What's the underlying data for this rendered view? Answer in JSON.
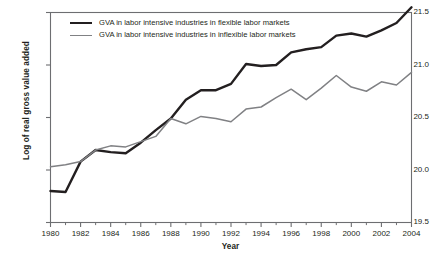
{
  "chart_data": {
    "type": "line",
    "title": "",
    "xlabel": "Year",
    "ylabel": "Log of real gross value added",
    "xlim": [
      1980,
      2004
    ],
    "ylim": [
      19.5,
      21.5
    ],
    "grid": false,
    "legend_position": "top-left-inside",
    "x": [
      1980,
      1981,
      1982,
      1983,
      1984,
      1985,
      1986,
      1987,
      1988,
      1989,
      1990,
      1991,
      1992,
      1993,
      1994,
      1995,
      1996,
      1997,
      1998,
      1999,
      2000,
      2001,
      2002,
      2003,
      2004
    ],
    "x_tick_labels": [
      "1980",
      "1982",
      "1984",
      "1986",
      "1988",
      "1990",
      "1992",
      "1994",
      "1996",
      "1998",
      "2000",
      "2002",
      "2004"
    ],
    "x_ticks_major": [
      1980,
      1982,
      1984,
      1986,
      1988,
      1990,
      1992,
      1994,
      1996,
      1998,
      2000,
      2002,
      2004
    ],
    "x_ticks_minor": [
      1981,
      1983,
      1985,
      1987,
      1989,
      1991,
      1993,
      1995,
      1997,
      1999,
      2001,
      2003
    ],
    "y_ticks": [
      19.5,
      20.0,
      20.5,
      21.0,
      21.5
    ],
    "y_tick_labels": [
      "19.5",
      "20.0",
      "20.5",
      "21.0",
      "21.5"
    ],
    "series": [
      {
        "name": "GVA in labor intensive industries in flexible labor markets",
        "color": "#231f20",
        "line_width": 2.4,
        "values": [
          19.8,
          19.79,
          20.08,
          20.19,
          20.17,
          20.16,
          20.26,
          20.38,
          20.49,
          20.67,
          20.76,
          20.76,
          20.82,
          21.01,
          20.99,
          21.0,
          21.12,
          21.15,
          21.17,
          21.28,
          21.3,
          21.27,
          21.33,
          21.4,
          21.55
        ]
      },
      {
        "name": "GVA in labor intensive industries in inflexible labor markets",
        "color": "#808184",
        "line_width": 1.5,
        "values": [
          20.03,
          20.05,
          20.08,
          20.19,
          20.23,
          20.22,
          20.27,
          20.32,
          20.49,
          20.44,
          20.51,
          20.49,
          20.46,
          20.58,
          20.6,
          20.69,
          20.77,
          20.67,
          20.78,
          20.9,
          20.79,
          20.75,
          20.84,
          20.81,
          20.93
        ]
      }
    ]
  },
  "legend": {
    "items": [
      {
        "label": "GVA in labor intensive industries in flexible labor markets"
      },
      {
        "label": "GVA in labor intensive industries in inflexible labor markets"
      }
    ]
  },
  "axes": {
    "x_title": "Year",
    "y_title": "Log of real gross value added"
  },
  "colors": {
    "flexible_series": "#231f20",
    "inflexible_series": "#808184",
    "frame": "#6d6e71",
    "text": "#231f20",
    "background": "#ffffff"
  }
}
